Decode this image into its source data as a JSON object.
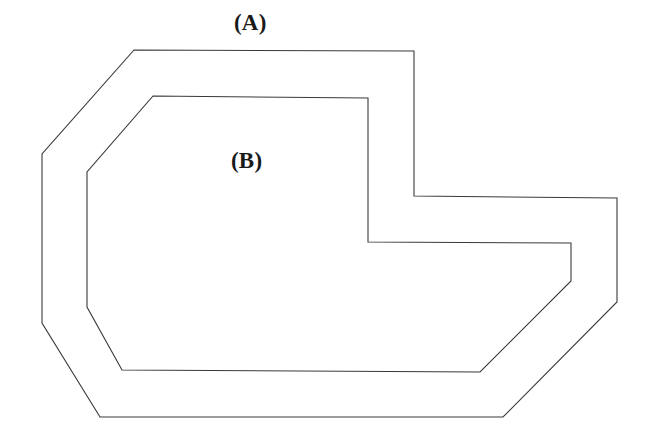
{
  "figure": {
    "background_color": "#ffffff",
    "stroke_color": "#3a3a3a",
    "fill_color": "#ffffff",
    "width": 657,
    "height": 437,
    "labels": [
      {
        "id": "a",
        "text": "(A)",
        "x": 234,
        "y": 11
      },
      {
        "id": "b",
        "text": "(B)",
        "x": 231,
        "y": 149
      }
    ],
    "shapes": [
      {
        "id": "outer-region",
        "name": "(A)",
        "points": "134,50 414,51 414,196 617,198 617,302 503,417 100,417 42,323 42,154"
      },
      {
        "id": "inner-region",
        "name": "(B)",
        "points": "153,96 368,98 368,242 571,243 571,281 480,372 122,370 87,307 87,172"
      }
    ]
  }
}
